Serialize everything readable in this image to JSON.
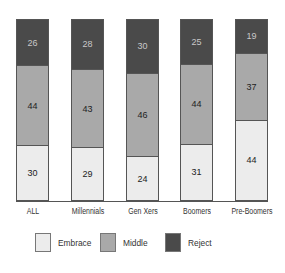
{
  "chart_data": {
    "type": "bar",
    "stacked": true,
    "orientation": "vertical",
    "title": "",
    "xlabel": "",
    "ylabel": "",
    "ylim": [
      0,
      100
    ],
    "grid": false,
    "legend_position": "bottom",
    "categories": [
      "ALL",
      "Millennials",
      "Gen Xers",
      "Boomers",
      "Pre-Boomers"
    ],
    "series": [
      {
        "name": "Embrace",
        "color": "#ececec",
        "values": [
          30,
          29,
          24,
          31,
          44
        ]
      },
      {
        "name": "Middle",
        "color": "#a9a9a9",
        "values": [
          44,
          43,
          46,
          44,
          37
        ]
      },
      {
        "name": "Reject",
        "color": "#4a4a4a",
        "values": [
          26,
          28,
          30,
          25,
          19
        ]
      }
    ]
  },
  "labels": {
    "categories": [
      "ALL",
      "Millennials",
      "Gen Xers",
      "Boomers",
      "Pre-Boomers"
    ],
    "legend": [
      "Embrace",
      "Middle",
      "Reject"
    ],
    "values": {
      "embrace": [
        "30",
        "29",
        "24",
        "31",
        "44"
      ],
      "middle": [
        "44",
        "43",
        "46",
        "44",
        "37"
      ],
      "reject": [
        "26",
        "28",
        "30",
        "25",
        "19"
      ]
    }
  }
}
